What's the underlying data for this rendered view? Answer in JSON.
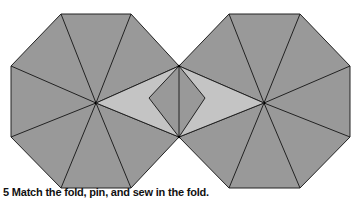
{
  "caption": "5 Match the fold, pin, and sew in the fold.",
  "colors": {
    "panel_fill": "#999999",
    "fold_fill": "#c4c4c4",
    "line": "#222222",
    "background": "#ffffff"
  },
  "left_octagon": {
    "center": [
      96,
      103
    ],
    "vertices": [
      [
        61,
        14
      ],
      [
        131,
        14
      ],
      [
        179,
        66
      ],
      [
        179,
        137
      ],
      [
        131,
        188
      ],
      [
        61,
        188
      ],
      [
        11,
        137
      ],
      [
        11,
        66
      ]
    ]
  },
  "right_octagon": {
    "center": [
      264,
      103
    ],
    "vertices": [
      [
        229,
        14
      ],
      [
        300,
        14
      ],
      [
        350,
        66
      ],
      [
        350,
        137
      ],
      [
        300,
        188
      ],
      [
        229,
        188
      ],
      [
        179,
        137
      ],
      [
        179,
        66
      ]
    ]
  },
  "fold_region": {
    "left_triangle": [
      [
        96,
        103
      ],
      [
        179,
        66
      ],
      [
        179,
        137
      ]
    ],
    "right_triangle": [
      [
        264,
        103
      ],
      [
        179,
        66
      ],
      [
        179,
        137
      ]
    ],
    "diamond": [
      [
        179,
        66
      ],
      [
        149,
        98
      ],
      [
        179,
        137
      ],
      [
        205,
        98
      ]
    ]
  }
}
